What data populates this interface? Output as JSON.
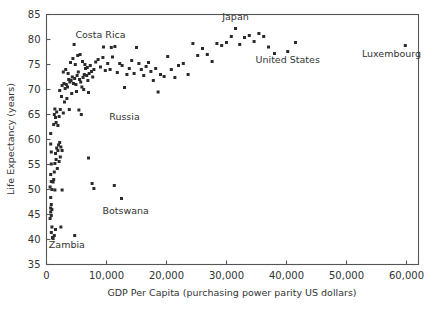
{
  "chart_data": {
    "type": "scatter",
    "title": "",
    "xlabel": "GDP Per Capita (purchasing power parity US dollars)",
    "ylabel": "Life Expectancy (years)",
    "xlim": [
      0,
      62000
    ],
    "ylim": [
      35,
      85
    ],
    "xticks": [
      0,
      10000,
      20000,
      30000,
      40000,
      50000,
      60000
    ],
    "xticklabels": [
      "0",
      "10,000",
      "20,000",
      "30,000",
      "40,000",
      "50,000",
      "60,000"
    ],
    "yticks": [
      35,
      40,
      45,
      50,
      55,
      60,
      65,
      70,
      75,
      80,
      85
    ],
    "yticklabels": [
      "35",
      "40",
      "45",
      "50",
      "55",
      "60",
      "65",
      "70",
      "75",
      "80",
      "85"
    ],
    "grid": false,
    "legend": null,
    "marker": "square",
    "marker_color": "#2b2b2b",
    "marker_size": 3,
    "annotations": [
      {
        "text": "Costa Rica",
        "x": 9000,
        "y": 80.4,
        "anchor": "middle"
      },
      {
        "text": "Japan",
        "x": 31500,
        "y": 84.0,
        "anchor": "middle"
      },
      {
        "text": "United States",
        "x": 40200,
        "y": 75.3,
        "anchor": "middle"
      },
      {
        "text": "Luxembourg",
        "x": 57500,
        "y": 76.5,
        "anchor": "middle"
      },
      {
        "text": "Russia",
        "x": 13000,
        "y": 64.0,
        "anchor": "middle"
      },
      {
        "text": "Botswana",
        "x": 13200,
        "y": 45.2,
        "anchor": "middle"
      },
      {
        "text": "Zambia",
        "x": 3400,
        "y": 38.4,
        "anchor": "middle"
      }
    ],
    "points": [
      [
        700,
        61.2
      ],
      [
        700,
        59.1
      ],
      [
        800,
        57.5
      ],
      [
        800,
        55.1
      ],
      [
        700,
        53.0
      ],
      [
        800,
        51.6
      ],
      [
        600,
        50.5
      ],
      [
        900,
        50.0
      ],
      [
        700,
        48.4
      ],
      [
        800,
        47.0
      ],
      [
        700,
        46.3
      ],
      [
        900,
        46.0
      ],
      [
        700,
        45.5
      ],
      [
        800,
        44.8
      ],
      [
        600,
        44.2
      ],
      [
        900,
        42.5
      ],
      [
        800,
        41.4
      ],
      [
        1000,
        40.4
      ],
      [
        1100,
        40.2
      ],
      [
        1300,
        40.8
      ],
      [
        1500,
        42.0
      ],
      [
        2400,
        42.5
      ],
      [
        4700,
        40.8
      ],
      [
        1100,
        51.5
      ],
      [
        1200,
        52.0
      ],
      [
        1300,
        53.5
      ],
      [
        1400,
        55.2
      ],
      [
        1600,
        56.0
      ],
      [
        1500,
        57.2
      ],
      [
        1700,
        58.3
      ],
      [
        1900,
        57.8
      ],
      [
        2000,
        58.9
      ],
      [
        2200,
        59.4
      ],
      [
        2400,
        58.5
      ],
      [
        2600,
        57.8
      ],
      [
        2300,
        56.5
      ],
      [
        2100,
        55.6
      ],
      [
        1800,
        54.2
      ],
      [
        1400,
        49.9
      ],
      [
        2600,
        49.9
      ],
      [
        1200,
        63.0
      ],
      [
        1300,
        65.0
      ],
      [
        1400,
        66.1
      ],
      [
        1500,
        64.4
      ],
      [
        1600,
        63.4
      ],
      [
        1700,
        65.5
      ],
      [
        1900,
        62.8
      ],
      [
        2100,
        64.6
      ],
      [
        2300,
        66.0
      ],
      [
        2800,
        65.3
      ],
      [
        3000,
        67.5
      ],
      [
        2500,
        68.6
      ],
      [
        2200,
        69.8
      ],
      [
        2600,
        70.8
      ],
      [
        2900,
        71.2
      ],
      [
        3100,
        70.2
      ],
      [
        3300,
        71.0
      ],
      [
        3500,
        70.5
      ],
      [
        3700,
        72.0
      ],
      [
        3900,
        71.5
      ],
      [
        4100,
        71.8
      ],
      [
        4300,
        72.5
      ],
      [
        4500,
        71.2
      ],
      [
        4700,
        72.2
      ],
      [
        4900,
        71.0
      ],
      [
        5100,
        72.8
      ],
      [
        5300,
        73.5
      ],
      [
        5500,
        72.0
      ],
      [
        5700,
        71.5
      ],
      [
        5900,
        70.5
      ],
      [
        6100,
        72.4
      ],
      [
        6300,
        73.0
      ],
      [
        6500,
        74.2
      ],
      [
        6700,
        72.8
      ],
      [
        6900,
        71.8
      ],
      [
        7100,
        73.2
      ],
      [
        7300,
        74.8
      ],
      [
        7500,
        73.6
      ],
      [
        3200,
        74.0
      ],
      [
        3600,
        73.2
      ],
      [
        4000,
        75.4
      ],
      [
        4400,
        76.2
      ],
      [
        4800,
        75.0
      ],
      [
        5200,
        76.8
      ],
      [
        5600,
        77.0
      ],
      [
        6000,
        75.6
      ],
      [
        6400,
        75.0
      ],
      [
        6800,
        74.4
      ],
      [
        2800,
        73.5
      ],
      [
        3400,
        68.2
      ],
      [
        3800,
        66.0
      ],
      [
        4200,
        69.2
      ],
      [
        5000,
        69.6
      ],
      [
        5400,
        65.9
      ],
      [
        6200,
        70.0
      ],
      [
        7000,
        69.4
      ],
      [
        7700,
        72.5
      ],
      [
        7900,
        74.0
      ],
      [
        8200,
        75.5
      ],
      [
        8600,
        76.0
      ],
      [
        9000,
        74.5
      ],
      [
        9400,
        76.4
      ],
      [
        9800,
        73.8
      ],
      [
        10200,
        75.2
      ],
      [
        10600,
        74.0
      ],
      [
        11000,
        76.5
      ],
      [
        11400,
        78.6
      ],
      [
        11800,
        73.4
      ],
      [
        12200,
        75.2
      ],
      [
        12600,
        74.8
      ],
      [
        13000,
        70.4
      ],
      [
        13400,
        73.0
      ],
      [
        13800,
        74.2
      ],
      [
        14200,
        75.8
      ],
      [
        14600,
        73.2
      ],
      [
        15000,
        78.4
      ],
      [
        15400,
        75.2
      ],
      [
        15800,
        74.0
      ],
      [
        16200,
        72.8
      ],
      [
        16600,
        74.6
      ],
      [
        17000,
        75.4
      ],
      [
        17400,
        73.6
      ],
      [
        17800,
        71.8
      ],
      [
        18200,
        74.2
      ],
      [
        18600,
        69.5
      ],
      [
        19000,
        73.0
      ],
      [
        19600,
        72.6
      ],
      [
        20200,
        76.6
      ],
      [
        20800,
        74.0
      ],
      [
        21400,
        72.4
      ],
      [
        22000,
        74.8
      ],
      [
        22800,
        75.2
      ],
      [
        23600,
        73.0
      ],
      [
        24400,
        79.2
      ],
      [
        25200,
        76.8
      ],
      [
        26000,
        78.2
      ],
      [
        26800,
        77.0
      ],
      [
        27600,
        75.6
      ],
      [
        28400,
        79.2
      ],
      [
        29200,
        78.8
      ],
      [
        30000,
        79.4
      ],
      [
        30800,
        80.6
      ],
      [
        31500,
        82.2
      ],
      [
        32200,
        79.0
      ],
      [
        33000,
        80.4
      ],
      [
        33800,
        80.8
      ],
      [
        34600,
        79.6
      ],
      [
        35400,
        81.2
      ],
      [
        36200,
        80.6
      ],
      [
        37000,
        78.5
      ],
      [
        38000,
        77.2
      ],
      [
        40200,
        77.6
      ],
      [
        41500,
        79.4
      ],
      [
        7000,
        56.3
      ],
      [
        7600,
        51.2
      ],
      [
        7900,
        50.2
      ],
      [
        11300,
        50.8
      ],
      [
        12500,
        48.2
      ],
      [
        9500,
        78.5
      ],
      [
        10800,
        78.4
      ],
      [
        4600,
        79.0
      ],
      [
        5800,
        65.0
      ],
      [
        59800,
        78.8
      ]
    ]
  },
  "axis_label_color": "#333333",
  "axis_line_color": "#555555"
}
